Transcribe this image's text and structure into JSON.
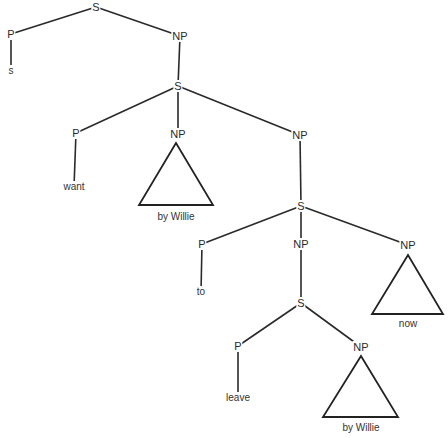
{
  "diagram": {
    "type": "syntax-tree",
    "nodes": [
      {
        "id": "s1",
        "label": "S",
        "x": 96,
        "y": 7
      },
      {
        "id": "p1",
        "label": "P",
        "x": 11,
        "y": 34
      },
      {
        "id": "leaf_s",
        "label": "s",
        "x": 11,
        "y": 71,
        "leaf": true
      },
      {
        "id": "np1",
        "label": "NP",
        "x": 180,
        "y": 36
      },
      {
        "id": "s2",
        "label": "S",
        "x": 178,
        "y": 86
      },
      {
        "id": "p2",
        "label": "P",
        "x": 76,
        "y": 133
      },
      {
        "id": "leaf_want",
        "label": "want",
        "x": 74,
        "y": 187,
        "leaf": true
      },
      {
        "id": "np2",
        "label": "NP",
        "x": 178,
        "y": 134
      },
      {
        "id": "leaf_bywillie1",
        "label": "by Willie",
        "x": 176,
        "y": 217,
        "leaf": true
      },
      {
        "id": "np3",
        "label": "NP",
        "x": 300,
        "y": 135
      },
      {
        "id": "s3",
        "label": "S",
        "x": 301,
        "y": 206
      },
      {
        "id": "p3",
        "label": "P",
        "x": 202,
        "y": 244
      },
      {
        "id": "leaf_to",
        "label": "to",
        "x": 201,
        "y": 292,
        "leaf": true
      },
      {
        "id": "np4",
        "label": "NP",
        "x": 301,
        "y": 244
      },
      {
        "id": "np5",
        "label": "NP",
        "x": 408,
        "y": 245
      },
      {
        "id": "leaf_now",
        "label": "now",
        "x": 408,
        "y": 324,
        "leaf": true
      },
      {
        "id": "s4",
        "label": "S",
        "x": 301,
        "y": 303
      },
      {
        "id": "p4",
        "label": "P",
        "x": 238,
        "y": 346
      },
      {
        "id": "leaf_leave",
        "label": "leave",
        "x": 238,
        "y": 398,
        "leaf": true
      },
      {
        "id": "np6",
        "label": "NP",
        "x": 361,
        "y": 347
      },
      {
        "id": "leaf_bywillie2",
        "label": "by Willie",
        "x": 361,
        "y": 428,
        "leaf": true
      }
    ],
    "edges": [
      {
        "from": "s1",
        "to": "p1"
      },
      {
        "from": "s1",
        "to": "np1"
      },
      {
        "from": "p1",
        "to": "leaf_s"
      },
      {
        "from": "np1",
        "to": "s2"
      },
      {
        "from": "s2",
        "to": "p2"
      },
      {
        "from": "s2",
        "to": "np2"
      },
      {
        "from": "s2",
        "to": "np3"
      },
      {
        "from": "p2",
        "to": "leaf_want"
      },
      {
        "from": "np3",
        "to": "s3"
      },
      {
        "from": "s3",
        "to": "p3"
      },
      {
        "from": "s3",
        "to": "np4"
      },
      {
        "from": "s3",
        "to": "np5"
      },
      {
        "from": "p3",
        "to": "leaf_to"
      },
      {
        "from": "np4",
        "to": "s4"
      },
      {
        "from": "s4",
        "to": "p4"
      },
      {
        "from": "s4",
        "to": "np6"
      },
      {
        "from": "p4",
        "to": "leaf_leave"
      }
    ],
    "triangles": [
      {
        "under": "np2",
        "apex": [
          176,
          143
        ],
        "left": [
          139,
          205
        ],
        "right": [
          213,
          205
        ],
        "leaf": "leaf_bywillie1"
      },
      {
        "under": "np5",
        "apex": [
          408,
          255
        ],
        "left": [
          372,
          314
        ],
        "right": [
          443,
          314
        ],
        "leaf": "leaf_now"
      },
      {
        "under": "np6",
        "apex": [
          361,
          356
        ],
        "left": [
          323,
          417
        ],
        "right": [
          398,
          417
        ],
        "leaf": "leaf_bywillie2"
      }
    ]
  }
}
